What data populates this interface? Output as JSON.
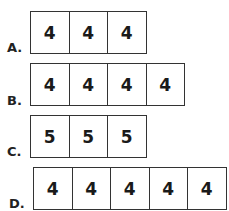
{
  "options": [
    {
      "label": "A.",
      "cells": [
        "4",
        "4",
        "4"
      ]
    },
    {
      "label": "B.",
      "cells": [
        "4",
        "4",
        "4",
        "4"
      ]
    },
    {
      "label": "C.",
      "cells": [
        "5",
        "5",
        "5"
      ]
    },
    {
      "label": "D.",
      "cells": [
        "4",
        "4",
        "4",
        "4",
        "4"
      ]
    }
  ]
}
